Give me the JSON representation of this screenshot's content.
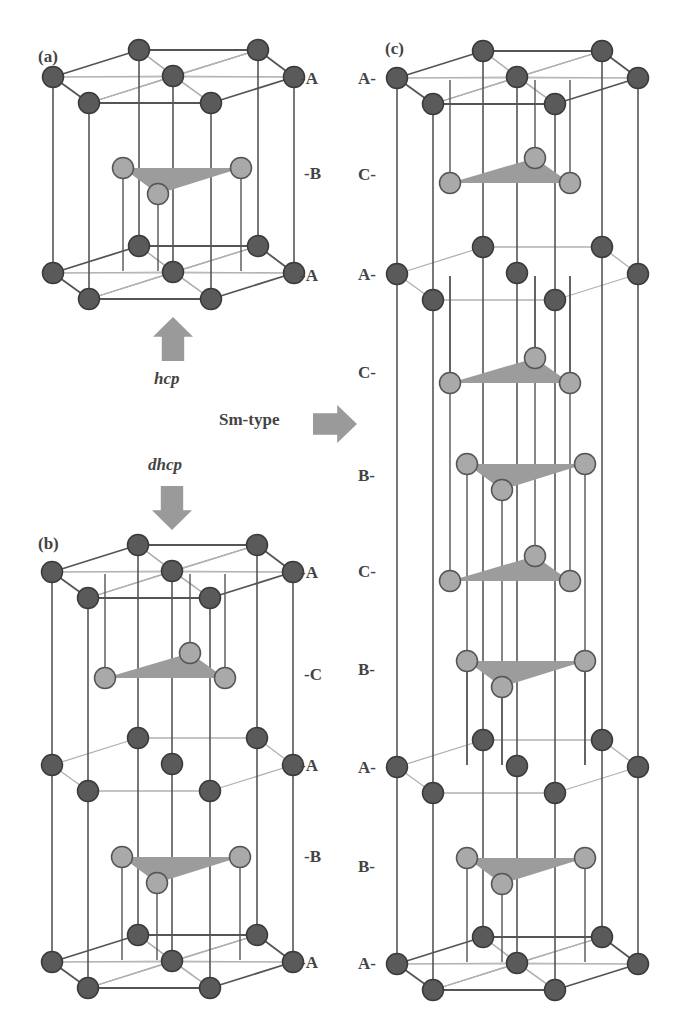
{
  "colors": {
    "frame_line": "#555555",
    "thin_line": "#b0b0b0",
    "dark_atom": "#5a5a5a",
    "dark_atom_edge": "#3a3a3a",
    "light_atom": "#a9a9a9",
    "light_atom_edge": "#555555",
    "triangle": "#9c9c9c",
    "arrow": "#9a9a9a",
    "text": "#444444"
  },
  "panels": {
    "a": {
      "label": "(a)",
      "label_pos": [
        38,
        48
      ],
      "layer_labels": [
        {
          "text": "-A",
          "x": 300,
          "y": 70
        },
        {
          "text": "-B",
          "x": 304,
          "y": 165
        },
        {
          "text": "-A",
          "x": 300,
          "y": 267
        }
      ],
      "a_layers": [
        77,
        273
      ],
      "bc_layers": [
        {
          "type": "B",
          "y": 168
        }
      ],
      "x0": 53
    },
    "b": {
      "label": "(b)",
      "label_pos": [
        38,
        535
      ],
      "layer_labels": [
        {
          "text": "-A",
          "x": 300,
          "y": 564
        },
        {
          "text": "-C",
          "x": 304,
          "y": 666
        },
        {
          "text": "-A",
          "x": 300,
          "y": 757
        },
        {
          "text": "-B",
          "x": 304,
          "y": 848
        },
        {
          "text": "-A",
          "x": 300,
          "y": 954
        }
      ],
      "a_layers": [
        572,
        765,
        962
      ],
      "bc_layers": [
        {
          "type": "C",
          "y": 678
        },
        {
          "type": "B",
          "y": 857
        }
      ],
      "x0": 52
    },
    "c": {
      "label": "(c)",
      "label_pos": [
        385,
        40
      ],
      "layer_labels": [
        {
          "text": "A-",
          "x": 358,
          "y": 70
        },
        {
          "text": "C-",
          "x": 358,
          "y": 166
        },
        {
          "text": "A-",
          "x": 358,
          "y": 266
        },
        {
          "text": "C-",
          "x": 358,
          "y": 364
        },
        {
          "text": "B-",
          "x": 358,
          "y": 467
        },
        {
          "text": "C-",
          "x": 358,
          "y": 563
        },
        {
          "text": "B-",
          "x": 358,
          "y": 661
        },
        {
          "text": "A-",
          "x": 358,
          "y": 759
        },
        {
          "text": "B-",
          "x": 358,
          "y": 858
        },
        {
          "text": "A-",
          "x": 358,
          "y": 955
        }
      ],
      "a_layers": [
        78,
        274,
        767,
        964
      ],
      "bc_layers": [
        {
          "type": "C",
          "y": 183
        },
        {
          "type": "C",
          "y": 383
        },
        {
          "type": "B",
          "y": 464
        },
        {
          "type": "C",
          "y": 581
        },
        {
          "type": "B",
          "y": 661
        },
        {
          "type": "B",
          "y": 858
        }
      ],
      "x0": 397
    }
  },
  "annotations": {
    "hcp": {
      "text": "hcp",
      "x": 154,
      "y": 370
    },
    "dhcp": {
      "text": "dhcp",
      "x": 148,
      "y": 456
    },
    "smtype": {
      "text": "Sm-type",
      "x": 219,
      "y": 411
    }
  },
  "arrows": {
    "up": {
      "x": 153,
      "y": 317,
      "w": 40,
      "h": 44
    },
    "down": {
      "x": 152,
      "y": 486,
      "w": 40,
      "h": 44
    },
    "right": {
      "x": 313,
      "y": 405,
      "w": 44,
      "h": 38
    }
  }
}
